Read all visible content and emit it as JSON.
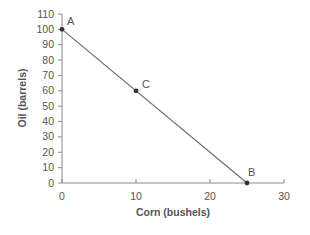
{
  "chart_data": {
    "type": "line",
    "title": "",
    "xlabel": "Corn (bushels)",
    "ylabel": "Oil (barrels)",
    "xlim": [
      0,
      30
    ],
    "ylim": [
      0,
      110
    ],
    "x_ticks": [
      0,
      10,
      20,
      30
    ],
    "y_ticks": [
      0,
      10,
      20,
      30,
      40,
      50,
      60,
      70,
      80,
      90,
      100,
      110
    ],
    "grid": false,
    "legend": null,
    "series": [
      {
        "name": "Production possibilities frontier",
        "x": [
          0,
          25
        ],
        "y": [
          100,
          0
        ]
      }
    ],
    "points": [
      {
        "label": "A",
        "x": 0,
        "y": 100
      },
      {
        "label": "C",
        "x": 10,
        "y": 60
      },
      {
        "label": "B",
        "x": 25,
        "y": 0
      }
    ],
    "colors": {
      "axis": "#8a8a8a",
      "line": "#6e6e6e",
      "point": "#333333",
      "text": "#555555"
    }
  }
}
